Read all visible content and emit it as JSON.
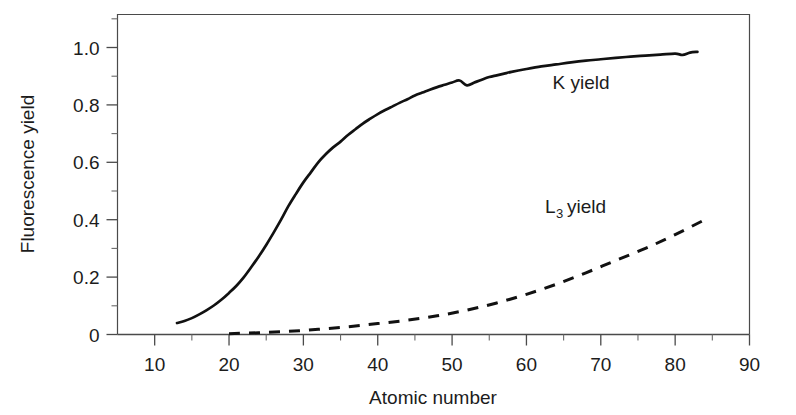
{
  "chart_data": {
    "type": "line",
    "title": "",
    "xlabel": "Atomic number",
    "ylabel": "Fluorescence yield",
    "xlim": [
      5,
      90
    ],
    "ylim": [
      0,
      1.115
    ],
    "grid": false,
    "legend_position": "inline-annotation",
    "x_ticks": [
      10,
      20,
      30,
      40,
      50,
      60,
      70,
      80,
      90
    ],
    "x_tick_labels": [
      "10",
      "20",
      "30",
      "40",
      "50",
      "60",
      "70",
      "80",
      "90"
    ],
    "x_minor_ticks": [
      15,
      25,
      35,
      45,
      55,
      65,
      75,
      85
    ],
    "y_ticks": [
      0,
      0.2,
      0.4,
      0.6,
      0.8,
      1.0
    ],
    "y_tick_labels": [
      "0",
      "0.2",
      "0.4",
      "0.6",
      "0.8",
      "1.0"
    ],
    "y_minor_ticks": [
      0.1,
      0.3,
      0.5,
      0.7,
      0.9,
      1.1
    ],
    "series": [
      {
        "name": "K yield",
        "style": "solid",
        "label_text": "K yield",
        "label_x": 63.5,
        "label_y": 0.855,
        "x": [
          13,
          14,
          15,
          16,
          17,
          18,
          19,
          20,
          21,
          22,
          23,
          24,
          25,
          26,
          27,
          28,
          29,
          30,
          31,
          32,
          33,
          34,
          35,
          36,
          37,
          38,
          39,
          40,
          41,
          42,
          43,
          44,
          45,
          46,
          47,
          48,
          49,
          50,
          51,
          52,
          53,
          54,
          55,
          56,
          57,
          58,
          60,
          62,
          64,
          66,
          68,
          70,
          72,
          74,
          76,
          78,
          80,
          81,
          82,
          83
        ],
        "y": [
          0.04,
          0.047,
          0.057,
          0.07,
          0.085,
          0.102,
          0.122,
          0.145,
          0.17,
          0.2,
          0.235,
          0.272,
          0.312,
          0.355,
          0.4,
          0.448,
          0.49,
          0.53,
          0.565,
          0.6,
          0.628,
          0.652,
          0.672,
          0.695,
          0.715,
          0.735,
          0.752,
          0.768,
          0.782,
          0.795,
          0.808,
          0.82,
          0.833,
          0.843,
          0.853,
          0.862,
          0.87,
          0.878,
          0.885,
          0.868,
          0.878,
          0.888,
          0.897,
          0.903,
          0.909,
          0.915,
          0.925,
          0.934,
          0.941,
          0.948,
          0.954,
          0.959,
          0.964,
          0.968,
          0.972,
          0.975,
          0.979,
          0.974,
          0.982,
          0.985
        ]
      },
      {
        "name": "L3 yield",
        "style": "dashed",
        "label_text": "yield",
        "label_main": "L",
        "label_sub": "3",
        "label_x": 62.5,
        "label_y": 0.425,
        "x": [
          20,
          24,
          28,
          32,
          36,
          40,
          44,
          48,
          52,
          56,
          60,
          64,
          68,
          72,
          76,
          80,
          84
        ],
        "y": [
          0.003,
          0.006,
          0.011,
          0.018,
          0.027,
          0.038,
          0.05,
          0.065,
          0.085,
          0.11,
          0.14,
          0.175,
          0.215,
          0.258,
          0.3,
          0.348,
          0.4
        ]
      }
    ]
  },
  "colors": {
    "curve": "#111111",
    "axis": "#4a4a4a",
    "text": "#1c1c1c",
    "background": "#ffffff"
  }
}
